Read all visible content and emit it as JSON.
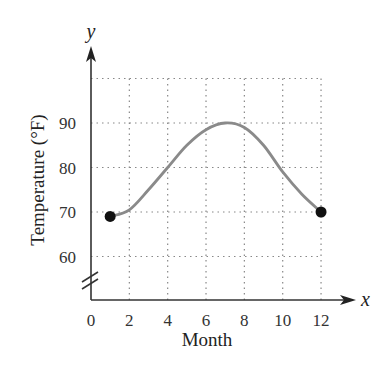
{
  "chart_data": {
    "type": "line",
    "title": "",
    "xlabel": "Month",
    "ylabel": "Temperature (°F)",
    "x_var": "x",
    "y_var": "y",
    "xlim": [
      0,
      13
    ],
    "ylim": [
      50,
      100
    ],
    "y_axis_break": true,
    "x_ticks": [
      "0",
      "2",
      "4",
      "6",
      "8",
      "10",
      "12"
    ],
    "y_ticks": [
      "60",
      "70",
      "80",
      "90"
    ],
    "grid": "dotted",
    "series": [
      {
        "name": "Temperature",
        "color": "#8a8a8a",
        "x": [
          1,
          2,
          3,
          4,
          5,
          6,
          7,
          8,
          9,
          10,
          11,
          12
        ],
        "values": [
          69,
          70.5,
          75,
          80,
          85,
          88.5,
          90,
          89,
          85,
          79,
          74,
          70
        ]
      }
    ],
    "endpoints": [
      {
        "x": 1,
        "y": 69
      },
      {
        "x": 12,
        "y": 70
      }
    ]
  }
}
